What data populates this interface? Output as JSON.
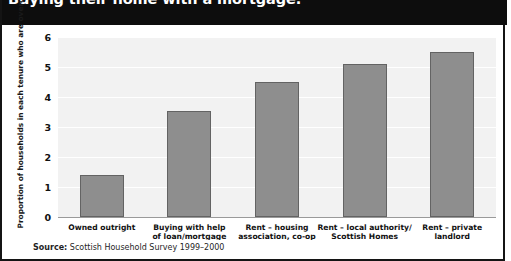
{
  "title": "Buying their home with a mortgage.",
  "source_prefix": "Source:",
  "source_text": "Scottish Household Survey 1999–2000",
  "colors": {
    "title_band": "#0d0d0d",
    "title_text": "#ffffff",
    "plot_background": "#f2f2f2",
    "gridline": "#ffffff",
    "bar_fill": "#8e8e8e",
    "bar_border": "#636363",
    "frame": "#141414"
  },
  "chart_data": {
    "type": "bar",
    "title": "Buying their home with a mortgage.",
    "xlabel": "",
    "ylabel": "Proportion of households in each tenure who are overcrowded (per cent)",
    "ylim": [
      0,
      6
    ],
    "yticks": [
      0,
      1,
      2,
      3,
      4,
      5,
      6
    ],
    "ytick_labels": [
      "0",
      "1",
      "2",
      "3",
      "4",
      "5",
      "6"
    ],
    "grid": true,
    "legend": false,
    "categories": [
      "Owned outright",
      "Buying with help of loan/mortgage",
      "Rent – housing association, co-op",
      "Rent – local authority/ Scottish Homes",
      "Rent – private landlord"
    ],
    "category_lines": [
      [
        "Owned outright"
      ],
      [
        "Buying with help",
        "of loan/mortgage"
      ],
      [
        "Rent – housing",
        "association, co-op"
      ],
      [
        "Rent – local authority/",
        "Scottish Homes"
      ],
      [
        "Rent – private",
        "landlord"
      ]
    ],
    "values": [
      1.4,
      3.55,
      4.5,
      5.1,
      5.5
    ],
    "units": "per cent"
  }
}
